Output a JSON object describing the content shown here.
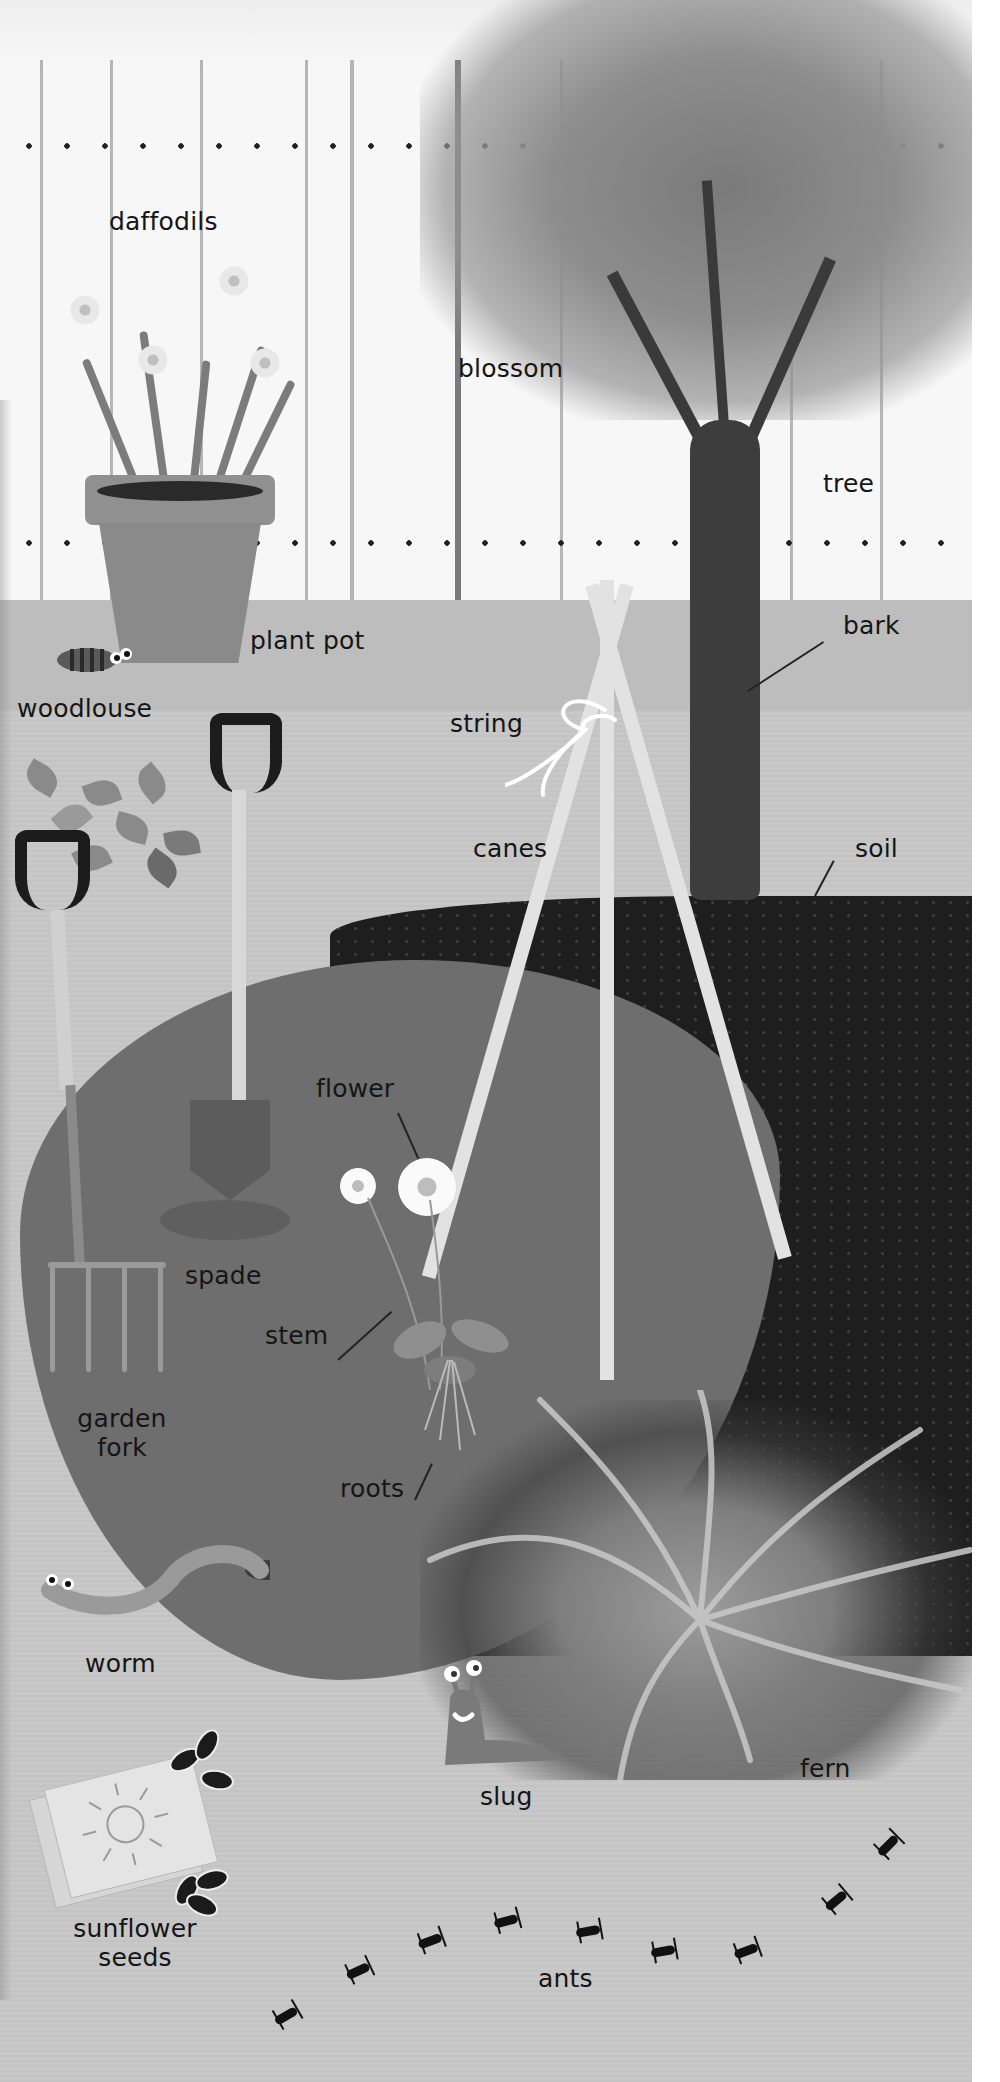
{
  "scene": {
    "title": "garden picture-word scene",
    "colors": {
      "fence": "#f7f7f7",
      "ground": "#c8c8c8",
      "dark_soil": "#1e1e1e",
      "flowerbed_blob": "#6e6e6e",
      "label_text": "#151515",
      "right_margin": "#ffffff"
    }
  },
  "labels": {
    "daffodils": "daffodils",
    "blossom": "blossom",
    "tree": "tree",
    "plant_pot": "plant pot",
    "bark": "bark",
    "woodlouse": "woodlouse",
    "string": "string",
    "canes": "canes",
    "soil": "soil",
    "flower": "flower",
    "spade": "spade",
    "stem": "stem",
    "garden_fork_line1": "garden",
    "garden_fork_line2": "fork",
    "roots": "roots",
    "worm": "worm",
    "slug": "slug",
    "fern": "fern",
    "sunflower_seeds_line1": "sunflower",
    "sunflower_seeds_line2": "seeds",
    "ants": "ants"
  },
  "objects": [
    {
      "name": "fence",
      "icon": "fence-icon"
    },
    {
      "name": "tree",
      "icon": "tree-icon"
    },
    {
      "name": "daffodils",
      "icon": "daffodil-icon"
    },
    {
      "name": "plant pot",
      "icon": "pot-icon"
    },
    {
      "name": "woodlouse",
      "icon": "woodlouse-icon"
    },
    {
      "name": "leaves",
      "icon": "leaf-icon"
    },
    {
      "name": "garden fork",
      "icon": "fork-icon"
    },
    {
      "name": "spade",
      "icon": "spade-icon"
    },
    {
      "name": "canes",
      "icon": "cane-icon"
    },
    {
      "name": "string",
      "icon": "string-bow-icon"
    },
    {
      "name": "flower",
      "icon": "daisy-icon"
    },
    {
      "name": "fern",
      "icon": "fern-icon"
    },
    {
      "name": "worm",
      "icon": "worm-icon"
    },
    {
      "name": "slug",
      "icon": "slug-icon"
    },
    {
      "name": "sunflower seeds",
      "icon": "seed-packet-icon"
    },
    {
      "name": "ants",
      "icon": "ant-icon",
      "count": 9
    }
  ]
}
